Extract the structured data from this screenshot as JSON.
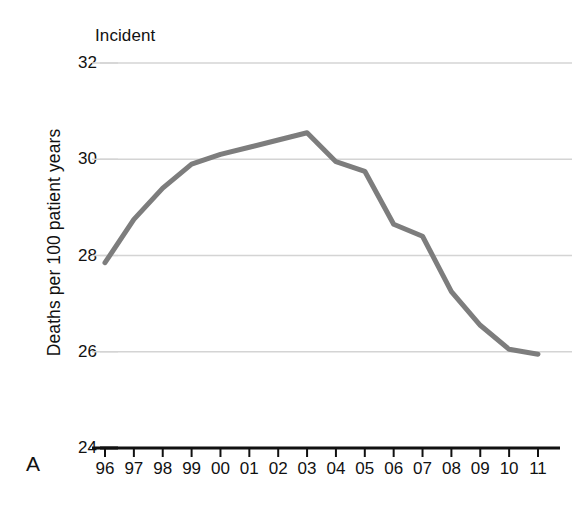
{
  "panel_label": "A",
  "title": "Incident",
  "y_axis_title": "Deaths per 100 patient years",
  "colors": {
    "line": "#7d7d7d",
    "gridline": "#d4d4d4",
    "axis": "#111111",
    "text": "#111111",
    "background": "#ffffff"
  },
  "chart_data": {
    "type": "line",
    "title": "Incident",
    "xlabel": "",
    "ylabel": "Deaths per 100 patient years",
    "categories": [
      "96",
      "97",
      "98",
      "99",
      "00",
      "01",
      "02",
      "03",
      "04",
      "05",
      "06",
      "07",
      "08",
      "09",
      "10",
      "11"
    ],
    "values": [
      27.85,
      28.75,
      29.4,
      29.9,
      30.1,
      30.25,
      30.4,
      30.55,
      29.95,
      29.75,
      28.65,
      28.4,
      27.25,
      26.55,
      26.05,
      25.95
    ],
    "series": [
      {
        "name": "Incident",
        "values": [
          27.85,
          28.75,
          29.4,
          29.9,
          30.1,
          30.25,
          30.4,
          30.55,
          29.95,
          29.75,
          28.65,
          28.4,
          27.25,
          26.55,
          26.05,
          25.95
        ]
      }
    ],
    "ylim": [
      24,
      32
    ],
    "yticks": [
      24,
      26,
      28,
      30,
      32
    ],
    "ytick_labels": [
      "24",
      "26",
      "28",
      "30",
      "32"
    ],
    "xtick_labels": [
      "96",
      "97",
      "98",
      "99",
      "00",
      "01",
      "02",
      "03",
      "04",
      "05",
      "06",
      "07",
      "08",
      "09",
      "10",
      "11"
    ],
    "grid": true,
    "grid_axis": "y",
    "legend": "none",
    "line_color": "#7d7d7d",
    "line_width": 5
  }
}
